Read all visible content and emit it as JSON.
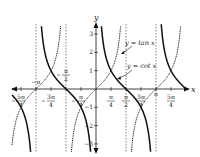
{
  "chart_data": {
    "type": "line",
    "title": "",
    "xlabel": "x",
    "ylabel": "y",
    "xlim": [
      -4.3,
      4.4
    ],
    "ylim": [
      -3.5,
      3.5
    ],
    "grid": false,
    "x_ticks": [
      {
        "value": -3.927,
        "label_num": "5π",
        "label_den": "4",
        "neg": true
      },
      {
        "value": -3.1416,
        "label": "−π"
      },
      {
        "value": -2.356,
        "label_num": "3π",
        "label_den": "4",
        "neg": true
      },
      {
        "value": -1.5708,
        "label_num": "π",
        "label_den": "2",
        "neg": true
      },
      {
        "value": -0.785,
        "label_num": "π",
        "label_den": "4",
        "neg": true
      },
      {
        "value": 0.785,
        "label_num": "π",
        "label_den": "4"
      },
      {
        "value": 1.5708,
        "label_num": "π",
        "label_den": "2"
      },
      {
        "value": 2.356,
        "label_num": "3π",
        "label_den": "4"
      },
      {
        "value": 3.1416,
        "label": "π"
      },
      {
        "value": 3.927,
        "label_num": "5π",
        "label_den": "4"
      }
    ],
    "y_ticks": [
      -3,
      -2,
      -1,
      1,
      2,
      3
    ],
    "asymptotes": [
      -3.1416,
      -1.5708,
      1.5708,
      3.1416
    ],
    "series": [
      {
        "name": "y = tan x",
        "function": "tan",
        "style": "dotted",
        "color": "#222222"
      },
      {
        "name": "y = cot x",
        "function": "cot",
        "style": "solid-bold",
        "color": "#111111"
      }
    ],
    "annotations": [
      {
        "text": "y = tan x",
        "points_to": "tan curve near x≈1.2"
      },
      {
        "text": "y = cot x",
        "points_to": "cot curve near x≈1.1"
      }
    ]
  },
  "labels": {
    "x_axis": "x",
    "y_axis": "y",
    "tan": "y = tan x",
    "cot": "y = cot x"
  }
}
